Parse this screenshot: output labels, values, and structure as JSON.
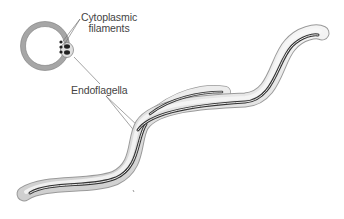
{
  "diagram": {
    "labels": {
      "cytoplasmic_filaments_line1": "Cytoplasmic",
      "cytoplasmic_filaments_line2": "filaments",
      "endoflagella": "Endoflagella"
    },
    "parts": [
      "cross-section",
      "cytoplasmic-filaments",
      "endoflagella",
      "spirochete-body"
    ],
    "colors": {
      "body_fill": "#e6e6e6",
      "body_outline": "#9a9a9a",
      "flagella": "#333333",
      "leader_line": "#666666",
      "text": "#444444"
    }
  }
}
